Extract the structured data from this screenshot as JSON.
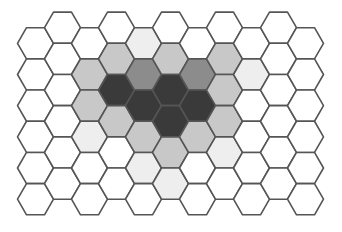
{
  "diagram": {
    "type": "hexagonal-grid",
    "layout": "flat-top, odd columns shifted up",
    "columns": 11,
    "rows": 6,
    "geometry": {
      "radius": 18,
      "col_spacing": 27,
      "row_spacing": 31.18,
      "origin_x": 35.5,
      "even_col_origin_y": 43.3,
      "odd_col_origin_y": 27.7
    },
    "stroke_color": "#555555",
    "shades": {
      "white": "#ffffff",
      "very_light": "#eeeeee",
      "light": "#c8c8c8",
      "medium": "#8c8c8c",
      "dark": "#3a3a3a"
    },
    "cells": [
      [
        "white",
        "white",
        "white",
        "white",
        "white",
        "white"
      ],
      [
        "white",
        "white",
        "white",
        "white",
        "white",
        "white"
      ],
      [
        "white",
        "light",
        "light",
        "very_light",
        "white",
        "white"
      ],
      [
        "white",
        "light",
        "dark",
        "light",
        "white",
        "white"
      ],
      [
        "very_light",
        "medium",
        "dark",
        "light",
        "very_light",
        "white"
      ],
      [
        "white",
        "light",
        "dark",
        "dark",
        "light",
        "very_light"
      ],
      [
        "white",
        "medium",
        "dark",
        "light",
        "white",
        "white"
      ],
      [
        "white",
        "light",
        "light",
        "light",
        "very_light",
        "white"
      ],
      [
        "white",
        "very_light",
        "white",
        "white",
        "white",
        "white"
      ],
      [
        "white",
        "white",
        "white",
        "white",
        "white",
        "white"
      ],
      [
        "white",
        "white",
        "white",
        "white",
        "white",
        "white"
      ]
    ]
  }
}
